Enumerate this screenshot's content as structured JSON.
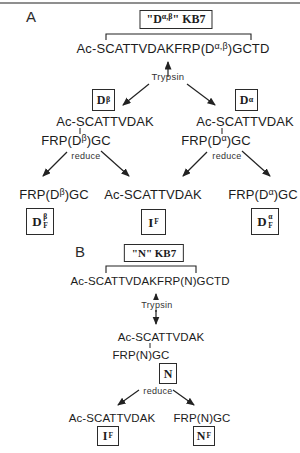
{
  "colors": {
    "ink": "#1c1c1c",
    "rule": "#8f8f8f",
    "box_border": "#2b2b2b"
  },
  "panelA": {
    "label": "A",
    "title": {
      "pre": "\"D",
      "sup": "α,β",
      "post": "\" KB7"
    },
    "sequence": {
      "pre": "Ac-SCATTVDAKFRP(D",
      "sup": "α,β",
      "post": ")GCTD"
    },
    "trypsin_label": "Trypsin",
    "box_beta": {
      "main": "D",
      "sup": "β"
    },
    "box_alpha": {
      "main": "D",
      "sup": "α"
    },
    "branch_left": {
      "top": "Ac-SCATTVDAK",
      "bottom": {
        "pre": "FRP(D",
        "sup": "β",
        "post": ")GC"
      }
    },
    "branch_right": {
      "top": "Ac-SCATTVDAK",
      "bottom": {
        "pre": "FRP(D",
        "sup": "α",
        "post": ")GC"
      }
    },
    "reduce_left": "reduce",
    "reduce_right": "reduce",
    "product_left": {
      "text": {
        "pre": "FRP(D",
        "sup": "β",
        "post": ")GC"
      },
      "box": {
        "main": "D",
        "sup": "β",
        "sub": "F"
      }
    },
    "product_center": {
      "text": "Ac-SCATTVDAK",
      "box": {
        "main": "I",
        "sub": "F"
      }
    },
    "product_right": {
      "text": {
        "pre": "FRP(D",
        "sup": "α",
        "post": ")GC"
      },
      "box": {
        "main": "D",
        "sup": "α",
        "sub": "F"
      }
    }
  },
  "panelB": {
    "label": "B",
    "title": {
      "pre": "\"N\" KB7"
    },
    "sequence": "Ac-SCATTVDAKFRP(N)GCTD",
    "trypsin_label": "Trypsin",
    "pair": {
      "top": "Ac-SCATTVDAK",
      "bottom": "FRP(N)GC"
    },
    "box_n": {
      "main": "N"
    },
    "reduce": "reduce",
    "product_left": {
      "text": "Ac-SCATTVDAK",
      "box": {
        "main": "I",
        "sub": "F"
      }
    },
    "product_right": {
      "text": "FRP(N)GC",
      "box": {
        "main": "N",
        "sub": "F"
      }
    }
  }
}
